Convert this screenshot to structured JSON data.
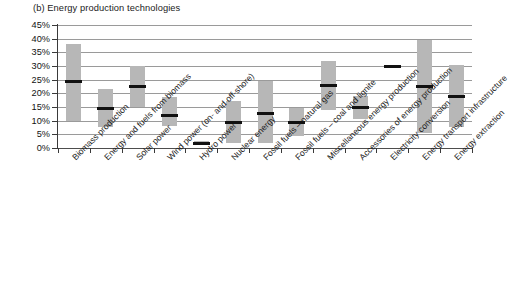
{
  "chart_data": {
    "type": "bar",
    "title": "(b) Energy production technologies",
    "xlabel": "",
    "ylabel": "",
    "ylim": [
      0,
      45
    ],
    "ytick_labels": [
      "0%",
      "5%",
      "10%",
      "15%",
      "20%",
      "25%",
      "30%",
      "35%",
      "40%",
      "45%"
    ],
    "ytick_values": [
      0,
      5,
      10,
      15,
      20,
      25,
      30,
      35,
      40,
      45
    ],
    "grid": true,
    "legend": "none",
    "categories": [
      "Biomass production",
      "Energy and fuels from biomass",
      "Solar power",
      "Wind power (on- and off-shore)",
      "Hydro power",
      "Nuclear energy",
      "Fossil fuels – natural gas",
      "Fossil fuels – coal and lignite",
      "Miscellaneous energy production",
      "Accessories of energy production",
      "Electricity conversion",
      "Energy transport infrastructure",
      "Energy extraction"
    ],
    "series": [
      {
        "name": "Range low",
        "values": [
          10.0,
          7.5,
          15.0,
          8.0,
          1.0,
          2.0,
          2.0,
          4.5,
          14.0,
          10.5,
          30.0,
          5.5,
          7.5
        ]
      },
      {
        "name": "Median",
        "values": [
          24.5,
          14.5,
          22.5,
          12.0,
          1.8,
          9.5,
          12.8,
          9.5,
          23.0,
          14.8,
          30.0,
          22.5,
          19.0
        ]
      },
      {
        "name": "Range high",
        "values": [
          38.0,
          21.5,
          30.0,
          18.8,
          2.5,
          17.2,
          24.5,
          14.5,
          32.0,
          19.0,
          30.5,
          39.5,
          30.5
        ]
      }
    ]
  },
  "colors": {
    "bar_fill": "#b7b7b7",
    "median": "#111111",
    "gridline": "#9a9a9a",
    "axis": "#3a3a3a",
    "text": "#1b1b1b",
    "background": "#ffffff"
  }
}
